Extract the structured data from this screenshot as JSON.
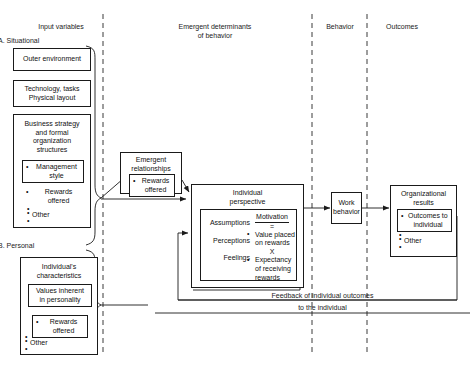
{
  "headers": {
    "input_variables": "Input variables",
    "emergent": "Emergent determinants\nof behavior",
    "emergent_line1": "Emergent determinants",
    "emergent_line2": "of behavior",
    "behavior": "Behavior",
    "outcomes": "Outcomes"
  },
  "sections": {
    "a_label": "A. Situational",
    "b_label": "B. Personal"
  },
  "input_boxes": {
    "outer_environment": "Outer environment",
    "technology_line1": "Technology, tasks",
    "technology_line2": "Physical layout",
    "business": {
      "title_line1": "Business strategy",
      "title_line2": "and formal",
      "title_line3": "organization",
      "title_line4": "structures",
      "management_style_line1": "Management",
      "management_style_line2": "style",
      "rewards_line1": "Rewards",
      "rewards_line2": "offered",
      "other": "Other"
    },
    "individual": {
      "title_line1": "Individual's",
      "title_line2": "characteristics",
      "values_line1": "Values inherent",
      "values_line2": "in personality",
      "rewards_line1": "Rewards",
      "rewards_line2": "offered",
      "other": "Other"
    }
  },
  "emergent_relationships": {
    "title_line1": "Emergent",
    "title_line2": "relationships",
    "rewards_line1": "Rewards",
    "rewards_line2": "offered"
  },
  "individual_perspective": {
    "title_line1": "Individual",
    "title_line2": "perspective",
    "left_items": [
      "Assumptions",
      "Perceptions",
      "Feelings"
    ],
    "motivation": {
      "heading": "Motivation",
      "equals": "=",
      "term1_line1": "Value placed",
      "term1_line2": "on rewards",
      "operator": "X",
      "term2_line1": "Expectancy",
      "term2_line2": "of receiving",
      "term2_line3": "rewards"
    }
  },
  "work_behavior": {
    "line1": "Work",
    "line2": "behavior"
  },
  "organizational_results": {
    "title_line1": "Organizational",
    "title_line2": "results",
    "outcomes_line1": "Outcomes to",
    "outcomes_line2": "individual",
    "other": "Other"
  },
  "feedback": {
    "line1": "Feedback of individual outcomes",
    "line2": "to the individual"
  },
  "colors": {
    "ink": "#1a1a1a",
    "paper": "#ffffff"
  }
}
